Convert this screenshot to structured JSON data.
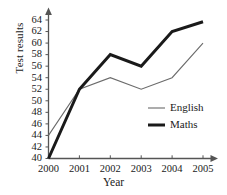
{
  "chart_data": {
    "type": "line",
    "title": "",
    "xlabel": "Year",
    "ylabel": "Test results",
    "categories": [
      "2000",
      "2001",
      "2002",
      "2003",
      "2004",
      "2005"
    ],
    "x": [
      2000,
      2001,
      2002,
      2003,
      2004,
      2005
    ],
    "xlim": [
      2000,
      2005
    ],
    "ylim": [
      40,
      64
    ],
    "yticks": [
      40,
      42,
      44,
      46,
      48,
      50,
      52,
      54,
      56,
      58,
      60,
      62,
      64
    ],
    "ytick_labels": [
      "40",
      "42",
      "44",
      "46",
      "48",
      "50",
      "52",
      "54",
      "56",
      "58",
      "60",
      "62",
      "64"
    ],
    "xticks": [
      2000,
      2001,
      2002,
      2003,
      2004,
      2005
    ],
    "xtick_labels": [
      "2000",
      "2001",
      "2002",
      "2003",
      "2004",
      "2005"
    ],
    "grid": false,
    "legend_position": "inside-lower-right",
    "series": [
      {
        "name": "English",
        "values": [
          44,
          52,
          54,
          52,
          54,
          60
        ],
        "color": "#6b6b6b",
        "line_width": 1.1,
        "style": "thin"
      },
      {
        "name": "Maths",
        "values": [
          40,
          52,
          58,
          56,
          62,
          63.7
        ],
        "color": "#1a1a1a",
        "line_width": 3.0,
        "style": "thick"
      }
    ]
  },
  "axes": {
    "axis_color": "#555555",
    "y_axis_name": "y-axis",
    "x_axis_name": "x-axis",
    "arrowheads": true
  },
  "legend": {
    "entries": [
      {
        "label": "English",
        "swatch": "thin-line-swatch"
      },
      {
        "label": "Maths",
        "swatch": "thick-line-swatch"
      }
    ]
  }
}
